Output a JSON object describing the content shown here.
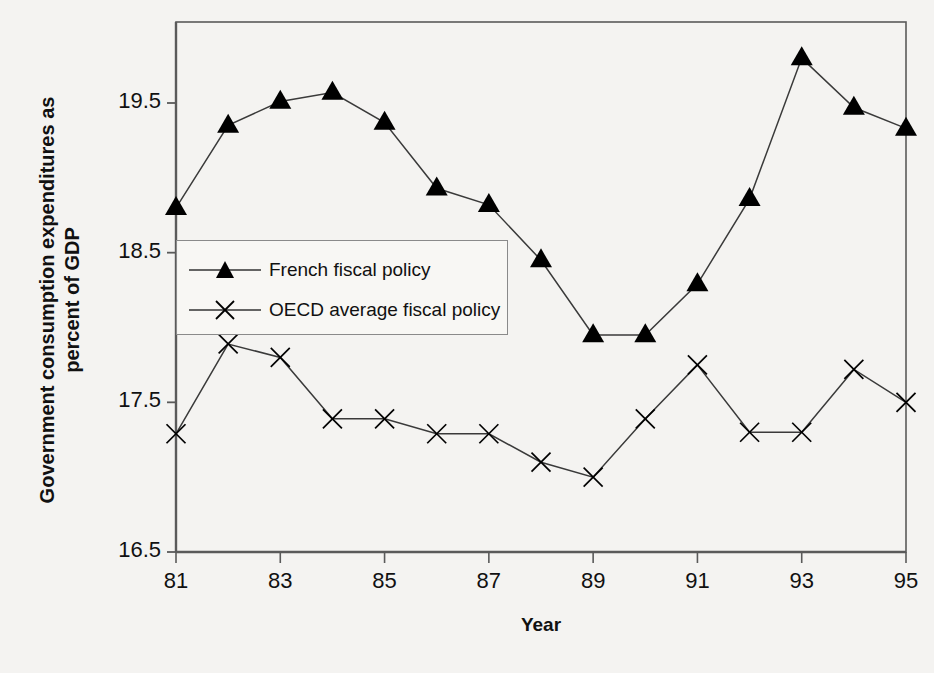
{
  "chart_data": {
    "type": "line",
    "title": "",
    "xlabel": "Year",
    "ylabel_lines": [
      "Government consumption expenditures as",
      "percent of GDP"
    ],
    "ylabel": "Government consumption expenditures as percent of GDP",
    "x": [
      81,
      82,
      83,
      84,
      85,
      86,
      87,
      88,
      89,
      90,
      91,
      92,
      93,
      94,
      95
    ],
    "xtick_labels": [
      "81",
      "83",
      "85",
      "87",
      "89",
      "91",
      "93",
      "95"
    ],
    "xtick_values": [
      81,
      83,
      85,
      87,
      89,
      91,
      93,
      95
    ],
    "ytick_labels": [
      "16.5",
      "17.5",
      "18.5",
      "19.5"
    ],
    "ytick_values": [
      16.5,
      17.5,
      18.5,
      19.5
    ],
    "xlim": [
      81,
      95
    ],
    "ylim": [
      16.5,
      19.95
    ],
    "grid": false,
    "legend_position": "inside-upper-left",
    "series": [
      {
        "name": "French fiscal policy",
        "marker": "triangle",
        "color": "#000000",
        "values": [
          18.8,
          19.35,
          19.51,
          19.57,
          19.37,
          18.93,
          18.82,
          18.45,
          17.95,
          17.95,
          18.29,
          18.86,
          19.8,
          19.47,
          19.33
        ]
      },
      {
        "name": "OECD average fiscal policy",
        "marker": "cross",
        "color": "#000000",
        "values": [
          17.29,
          17.89,
          17.8,
          17.39,
          17.39,
          17.29,
          17.29,
          17.1,
          17.0,
          17.39,
          17.75,
          17.3,
          17.3,
          17.72,
          17.5
        ]
      }
    ]
  },
  "legend": {
    "items": [
      {
        "label": "French fiscal policy",
        "marker": "triangle"
      },
      {
        "label": "OECD average fiscal policy",
        "marker": "cross"
      }
    ]
  },
  "colors": {
    "background": "#f4f3f1",
    "axis": "#5a5a5a",
    "series": "#000000",
    "text": "#111111",
    "legend_border": "#8a8a8a"
  }
}
